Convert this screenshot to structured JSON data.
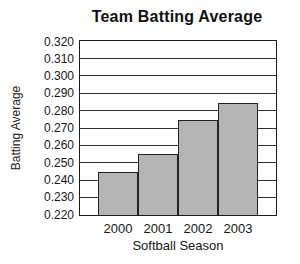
{
  "chart_data": {
    "type": "bar",
    "title": "Team Batting Average",
    "xlabel": "Softball Season",
    "ylabel": "Batting Average",
    "categories": [
      "2000",
      "2001",
      "2002",
      "2003"
    ],
    "values": [
      0.245,
      0.255,
      0.275,
      0.285
    ],
    "ylim": [
      0.22,
      0.32
    ],
    "ytick_step": 0.01,
    "ytick_labels": [
      "0.320",
      "0.310",
      "0.300",
      "0.290",
      "0.280",
      "0.270",
      "0.260",
      "0.250",
      "0.240",
      "0.230",
      "0.220"
    ],
    "grid": true,
    "legend": null,
    "colors": {
      "bar_fill": "#b5b5b5",
      "bar_border": "#222222",
      "gridline": "#2e2e2e",
      "axis_frame": "#1c1c1c",
      "text": "#161616",
      "background": "#ffffff"
    }
  }
}
